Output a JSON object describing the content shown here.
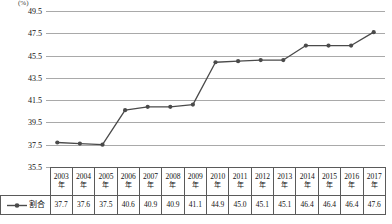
{
  "chart_data": {
    "type": "line",
    "title": "",
    "xlabel": "",
    "ylabel": "(%)",
    "unit": "(%)",
    "categories": [
      "2003年",
      "2004年",
      "2005年",
      "2006年",
      "2007年",
      "2008年",
      "2009年",
      "2010年",
      "2011年",
      "2012年",
      "2013年",
      "2014年",
      "2015年",
      "2016年",
      "2017年"
    ],
    "year_numbers": [
      "2003",
      "2004",
      "2005",
      "2006",
      "2007",
      "2008",
      "2009",
      "2010",
      "2011",
      "2012",
      "2013",
      "2014",
      "2015",
      "2016",
      "2017"
    ],
    "year_suffix": "年",
    "series": [
      {
        "name": "割合",
        "values": [
          37.7,
          37.6,
          37.5,
          40.6,
          40.9,
          40.9,
          41.1,
          44.9,
          45.0,
          45.1,
          45.1,
          46.4,
          46.4,
          46.4,
          47.6
        ],
        "color": "#4a4a4a",
        "marker": "circle"
      }
    ],
    "ylim": [
      35.5,
      49.5
    ],
    "ytick_step": 2.0,
    "yticks": [
      "49.5",
      "47.5",
      "45.5",
      "43.5",
      "41.5",
      "39.5",
      "37.5",
      "35.5"
    ],
    "ytick_values": [
      49.5,
      47.5,
      45.5,
      43.5,
      41.5,
      39.5,
      37.5,
      35.5
    ],
    "grid": true,
    "grid_color": "#a9a9a9",
    "legend_position": "table-row-header"
  },
  "legend": {
    "label": "割合",
    "marker_icon": "line-with-dot-marker"
  },
  "table": {
    "header_label": "",
    "rows": [
      {
        "label": "割合",
        "values": [
          "37.7",
          "37.6",
          "37.5",
          "40.6",
          "40.9",
          "40.9",
          "41.1",
          "44.9",
          "45.0",
          "45.1",
          "45.1",
          "46.4",
          "46.4",
          "46.4",
          "47.6"
        ]
      }
    ]
  }
}
